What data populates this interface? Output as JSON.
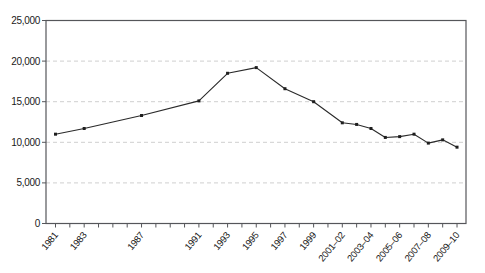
{
  "figure": {
    "title": "",
    "colors": {
      "background": "#ffffff",
      "plot_border": "#55565a",
      "gridline": "#cfcfcf",
      "line": "#2a2a2a",
      "marker": "#1f1f1f",
      "tick": "#55565a",
      "label_text": "#1a1a1a"
    }
  },
  "chart_data": {
    "type": "line",
    "title": "",
    "xlabel": "",
    "ylabel": "",
    "ylim": [
      0,
      25000
    ],
    "y_tick_step": 5000,
    "y_ticks": [
      {
        "value": 0,
        "label": "0"
      },
      {
        "value": 5000,
        "label": "5,000"
      },
      {
        "value": 10000,
        "label": "10,000"
      },
      {
        "value": 15000,
        "label": "15,000"
      },
      {
        "value": 20000,
        "label": "20,000"
      },
      {
        "value": 25000,
        "label": "25,000"
      }
    ],
    "grid": {
      "horizontal": true,
      "vertical": false,
      "style": "dashed"
    },
    "legend": "none",
    "plot_border": "full-box",
    "marker_shape": "small-square",
    "x_axis": {
      "tick_count": 29,
      "tick_unit": "1 year",
      "first_tick_category": "1981",
      "last_tick_category": "2009–10",
      "labels": [
        {
          "label": "1981",
          "tick_index": 0
        },
        {
          "label": "1983",
          "tick_index": 2
        },
        {
          "label": "1987",
          "tick_index": 6
        },
        {
          "label": "1991",
          "tick_index": 10
        },
        {
          "label": "1993",
          "tick_index": 12
        },
        {
          "label": "1995",
          "tick_index": 14
        },
        {
          "label": "1997",
          "tick_index": 16
        },
        {
          "label": "1999",
          "tick_index": 18
        },
        {
          "label": "2001–02",
          "tick_index": 20
        },
        {
          "label": "2003–04",
          "tick_index": 22
        },
        {
          "label": "2005–06",
          "tick_index": 24
        },
        {
          "label": "2007–08",
          "tick_index": 26
        },
        {
          "label": "2009–10",
          "tick_index": 28
        }
      ]
    },
    "series": [
      {
        "name": "series-1",
        "points": [
          {
            "category": "1981",
            "tick_index": 0,
            "value": 11000
          },
          {
            "category": "1983",
            "tick_index": 2,
            "value": 11700
          },
          {
            "category": "1987",
            "tick_index": 6,
            "value": 13300
          },
          {
            "category": "1991",
            "tick_index": 10,
            "value": 15100
          },
          {
            "category": "1993",
            "tick_index": 12,
            "value": 18500
          },
          {
            "category": "1995",
            "tick_index": 14,
            "value": 19200
          },
          {
            "category": "1997",
            "tick_index": 16,
            "value": 16600
          },
          {
            "category": "1999",
            "tick_index": 18,
            "value": 15000
          },
          {
            "category": "2001–02",
            "tick_index": 20,
            "value": 12400
          },
          {
            "category": "2002–03",
            "tick_index": 21,
            "value": 12200
          },
          {
            "category": "2003–04",
            "tick_index": 22,
            "value": 11700
          },
          {
            "category": "2004–05",
            "tick_index": 23,
            "value": 10600
          },
          {
            "category": "2005–06",
            "tick_index": 24,
            "value": 10700
          },
          {
            "category": "2006–07",
            "tick_index": 25,
            "value": 11000
          },
          {
            "category": "2007–08",
            "tick_index": 26,
            "value": 9900
          },
          {
            "category": "2008–09",
            "tick_index": 27,
            "value": 10300
          },
          {
            "category": "2009–10",
            "tick_index": 28,
            "value": 9400
          }
        ]
      }
    ]
  }
}
